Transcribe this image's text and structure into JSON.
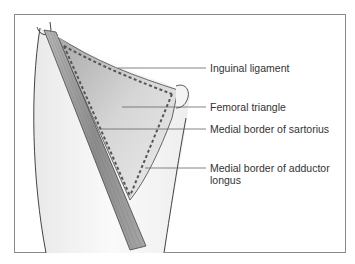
{
  "diagram": {
    "type": "anatomical-illustration",
    "labels": [
      {
        "id": "inguinal-ligament",
        "text": "Inguinal ligament"
      },
      {
        "id": "femoral-triangle",
        "text": "Femoral triangle"
      },
      {
        "id": "medial-border-sartorius",
        "text": "Medial border of sartorius"
      },
      {
        "id": "medial-border-adductor-longus",
        "line1": "Medial border of adductor",
        "line2": "longus"
      }
    ],
    "colors": {
      "frame": "#8a8a8a",
      "outline": "#444444",
      "thigh_fill": "#f4f4f4",
      "triangle_fill": "#c8c8c8",
      "sartorius_fill": "#9a9a9a",
      "dashed_border": "#555555",
      "leader_line": "#666666",
      "label_text": "#333333"
    }
  }
}
